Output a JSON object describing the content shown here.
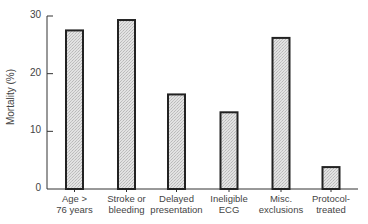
{
  "chart_data": {
    "type": "bar",
    "title": "",
    "xlabel": "",
    "ylabel": "Mortality (%)",
    "ylim": [
      0,
      30
    ],
    "yticks": [
      0,
      10,
      20,
      30
    ],
    "grid": false,
    "legend": null,
    "categories": [
      "Age > 76 years",
      "Stroke or bleeding",
      "Delayed presentation",
      "Ineligible ECG",
      "Misc. exclusions",
      "Protocol-treated"
    ],
    "category_lines": [
      [
        "Age  >",
        "76 years"
      ],
      [
        "Stroke or",
        "bleeding"
      ],
      [
        "Delayed",
        "presentation"
      ],
      [
        "Ineligible",
        "ECG"
      ],
      [
        "Misc.",
        "exclusions"
      ],
      [
        "Protocol-",
        "treated"
      ]
    ],
    "values": [
      27.5,
      29.3,
      16.4,
      13.3,
      26.2,
      3.8
    ],
    "colors": {
      "bar_fill": "#dcdcdc",
      "bar_stroke": "#222222",
      "axis": "#333333"
    }
  }
}
